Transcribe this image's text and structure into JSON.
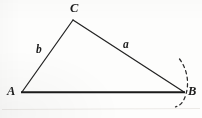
{
  "figure": {
    "kind": "geometry-diagram",
    "caption": "",
    "background_color": "#fdfdfc",
    "stroke_color": "#1c1c1c",
    "vertices": [
      {
        "id": "A",
        "label": "A",
        "x": 22,
        "y": 92
      },
      {
        "id": "B",
        "label": "B",
        "x": 183,
        "y": 92
      },
      {
        "id": "C",
        "label": "C",
        "x": 73,
        "y": 20
      }
    ],
    "sides": [
      {
        "id": "AB",
        "label": "",
        "from": "A",
        "to": "B",
        "width": 2.1
      },
      {
        "id": "AC",
        "label": "b",
        "from": "A",
        "to": "C",
        "width": 1.2
      },
      {
        "id": "CB",
        "label": "a",
        "from": "C",
        "to": "B",
        "width": 1.2
      }
    ],
    "side_labels": [
      {
        "id": "b",
        "text": "b",
        "x": 41,
        "y": 50
      },
      {
        "id": "a",
        "text": "a",
        "x": 127,
        "y": 45
      }
    ],
    "vertex_labels": [
      {
        "id": "C",
        "text": "C",
        "x": 74,
        "y": 8
      },
      {
        "id": "A",
        "text": "A",
        "x": 12,
        "y": 91
      },
      {
        "id": "B",
        "text": "B",
        "x": 192,
        "y": 92
      }
    ],
    "arc": {
      "id": "construction-arc-at-B",
      "style": "dashed",
      "dash_pattern": "3 3",
      "width": 1.2,
      "path": "M 179.5 59 C 187.5 69, 189.5 84, 185.5 96 C 183 103, 179 106, 175.5 106.5"
    },
    "artifacts": {
      "scan_line": {
        "y": 109,
        "color": "#e9e9e6"
      }
    }
  }
}
